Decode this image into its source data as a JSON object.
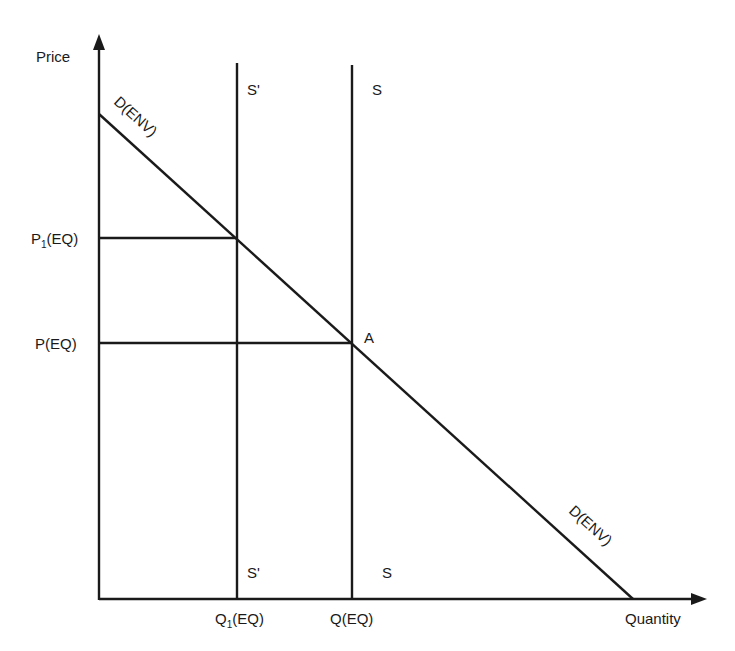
{
  "axes": {
    "y_label": "Price",
    "x_label": "Quantity"
  },
  "curves": {
    "supply_shifted": {
      "label_top": "S'",
      "label_bottom": "S'"
    },
    "supply": {
      "label_top": "S",
      "label_bottom": "S"
    },
    "demand": {
      "label_top": "D(ENV)",
      "label_bottom": "D(ENV)"
    }
  },
  "points": {
    "equilibrium": "A"
  },
  "ticks": {
    "p1": "P",
    "p1_sub": "1",
    "p1_suffix": "(EQ)",
    "p": "P(EQ)",
    "q1": "Q",
    "q1_sub": "1",
    "q1_suffix": "(EQ)",
    "q": "Q(EQ)"
  },
  "colors": {
    "line": "#1a1a1a",
    "background": "#ffffff"
  }
}
